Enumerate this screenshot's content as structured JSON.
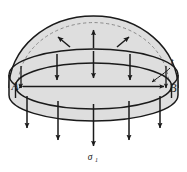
{
  "figure": {
    "background_color": "#ffffff",
    "shell_fill_color": "#dedede",
    "shell_fill_color_light": "#e6e6e6",
    "line_color": "#1a1a1a",
    "dashed_line_color": "#777777",
    "labels": {
      "left_point": "A",
      "right_point": "B",
      "thickness": "t",
      "stress_symbol": "σ",
      "stress_subscript": "1"
    },
    "annotations": {
      "diameter_arrow": "double-headed horizontal arrow from A to B",
      "internal_pressure_arrows": "three arrows inside dome pointing outward toward shell",
      "membrane_stress_arrows": "vertical arrows pointing downward",
      "thickness_leader": "leader line from t to shell wall"
    },
    "counts": {
      "pressure_arrows": 3,
      "upper_down_arrows": 3,
      "lower_down_arrows": 5
    }
  }
}
